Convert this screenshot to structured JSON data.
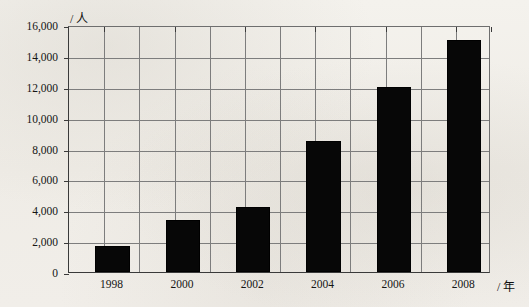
{
  "chart_data": {
    "type": "bar",
    "title": "",
    "subtitle": "",
    "xlabel": "/ 年",
    "ylabel": "/ 人",
    "categories": [
      "1998",
      "2000",
      "2002",
      "2004",
      "2006",
      "2008"
    ],
    "values": [
      1700,
      3400,
      4200,
      8500,
      12000,
      15000
    ],
    "ylim": [
      0,
      16000
    ],
    "ytick_labels": [
      "0",
      "2,000",
      "4,000",
      "6,000",
      "8,000",
      "10,000",
      "12,000",
      "14,000",
      "16,000"
    ],
    "ytick_values": [
      0,
      2000,
      4000,
      6000,
      8000,
      10000,
      12000,
      14000,
      16000
    ],
    "grid": true,
    "grid_vertical_columns": 12,
    "legend": [],
    "legend_position": "none",
    "bar_color": "#070707",
    "grid_color": "#7d7d7d",
    "axis_color": "#3a3a3a",
    "background_color": "#f2f0eb"
  },
  "axis_units": {
    "y_unit": "/ 人",
    "x_unit": "/ 年"
  },
  "background_artifacts": [
    "faint scanned text show-through",
    "faint scanned text show-through",
    "faint scanned text show-through"
  ]
}
